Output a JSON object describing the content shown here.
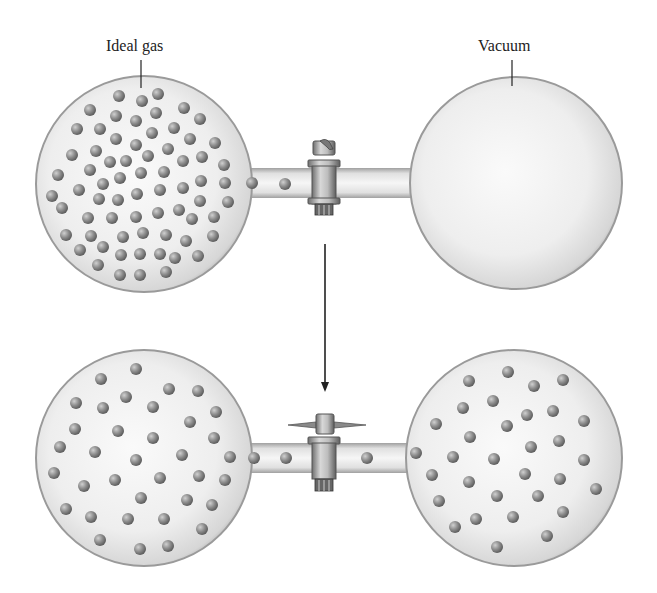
{
  "figure": {
    "labels": {
      "left_bulb": "Ideal gas",
      "right_bulb": "Vacuum"
    },
    "states": [
      {
        "name": "initial",
        "left_bulb": "gas (many molecules)",
        "right_bulb": "empty (vacuum)",
        "stopcock": "closed"
      },
      {
        "name": "final",
        "left_bulb": "gas (fewer molecules)",
        "right_bulb": "gas (fewer molecules)",
        "stopcock": "open"
      }
    ],
    "arrow": "down",
    "colors": {
      "glass_fill": "#e9e9e9",
      "glass_edge": "#9a9a9a",
      "molecule": "#8c8c8c",
      "stopcock": "#b5b5b5",
      "text": "#222222"
    }
  }
}
